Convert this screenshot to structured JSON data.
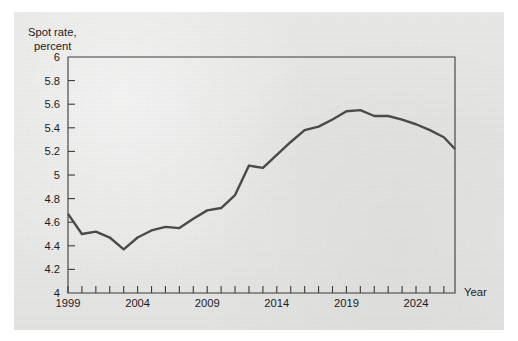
{
  "chart_data": {
    "type": "line",
    "title": "Spot rate, percent",
    "title_lines": [
      "Spot rate,",
      "percent"
    ],
    "xlabel": "Year",
    "ylabel": "",
    "xlim": [
      1999,
      2026.8
    ],
    "ylim": [
      4,
      6
    ],
    "grid": false,
    "legend": null,
    "y_ticks": [
      4,
      4.2,
      4.4,
      4.6,
      4.8,
      5,
      5.2,
      5.4,
      5.6,
      5.8,
      6
    ],
    "y_tick_labels": [
      "4",
      "4.2",
      "4.4",
      "4.6",
      "4.8",
      "5",
      "5.2",
      "5.4",
      "5.6",
      "5.8",
      "6"
    ],
    "x_tick_labels": [
      "1999",
      "2004",
      "2009",
      "2014",
      "2019",
      "2024"
    ],
    "x_labeled_ticks": [
      1999,
      2004,
      2009,
      2014,
      2019,
      2024
    ],
    "x_minor_tick_interval": 1,
    "series": [
      {
        "name": "Spot rate",
        "color": "#4a4a4a",
        "x": [
          1999,
          2000,
          2001,
          2002,
          2003,
          2004,
          2005,
          2006,
          2007,
          2008,
          2009,
          2010,
          2011,
          2012,
          2013,
          2014,
          2015,
          2016,
          2017,
          2018,
          2019,
          2020,
          2021,
          2022,
          2023,
          2024,
          2025,
          2026,
          2026.8
        ],
        "values": [
          4.67,
          4.5,
          4.52,
          4.47,
          4.37,
          4.47,
          4.53,
          4.56,
          4.55,
          4.63,
          4.7,
          4.72,
          4.83,
          5.08,
          5.06,
          5.17,
          5.28,
          5.38,
          5.41,
          5.47,
          5.54,
          5.55,
          5.5,
          5.5,
          5.47,
          5.43,
          5.38,
          5.32,
          5.22
        ]
      }
    ]
  },
  "figure": {
    "background_color": "#e7e7e6",
    "page_color": "#ffffff",
    "axis_color": "#3a3a3a",
    "line_color": "#4a4a4a"
  }
}
